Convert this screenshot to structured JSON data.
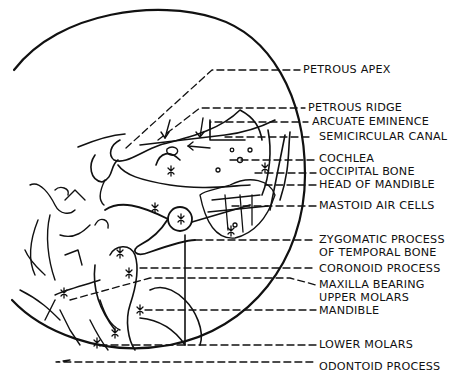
{
  "figure": {
    "type": "anatomical line diagram",
    "line_color": "#111111",
    "background": "#ffffff"
  },
  "labels": [
    {
      "id": "petrous-apex",
      "text": "PETROUS APEX",
      "x": 303,
      "y": 63
    },
    {
      "id": "petrous-ridge",
      "text": "PETROUS RIDGE",
      "x": 308,
      "y": 103
    },
    {
      "id": "arcuate-eminence",
      "text": "ARCUATE EMINENCE",
      "x": 312,
      "y": 118
    },
    {
      "id": "semicircular-canal",
      "text": "SEMICIRCULAR CANAL",
      "x": 319,
      "y": 132
    },
    {
      "id": "cochlea",
      "text": "COCHLEA",
      "x": 319,
      "y": 154
    },
    {
      "id": "occipital-bone",
      "text": "OCCIPITAL BONE",
      "x": 319,
      "y": 167
    },
    {
      "id": "head-of-mandible",
      "text": "HEAD OF MANDIBLE",
      "x": 319,
      "y": 180
    },
    {
      "id": "mastoid-air-cells",
      "text": "MASTOID AIR CELLS",
      "x": 319,
      "y": 200
    },
    {
      "id": "zygomatic-process-1",
      "text": "ZYGOMATIC PROCESS",
      "x": 319,
      "y": 233
    },
    {
      "id": "zygomatic-process-2",
      "text": "OF TEMPORAL BONE",
      "x": 319,
      "y": 246
    },
    {
      "id": "coronoid-process",
      "text": "CORONOID PROCESS",
      "x": 319,
      "y": 263
    },
    {
      "id": "maxilla-1",
      "text": "MAXILLA BEARING",
      "x": 319,
      "y": 279
    },
    {
      "id": "maxilla-2",
      "text": "UPPER MOLARS",
      "x": 319,
      "y": 293
    },
    {
      "id": "mandible",
      "text": "MANDIBLE",
      "x": 319,
      "y": 305
    },
    {
      "id": "lower-molars",
      "text": "LOWER MOLARS",
      "x": 319,
      "y": 340
    },
    {
      "id": "odontoid-process",
      "text": "ODONTOID PROCESS",
      "x": 319,
      "y": 361
    }
  ]
}
